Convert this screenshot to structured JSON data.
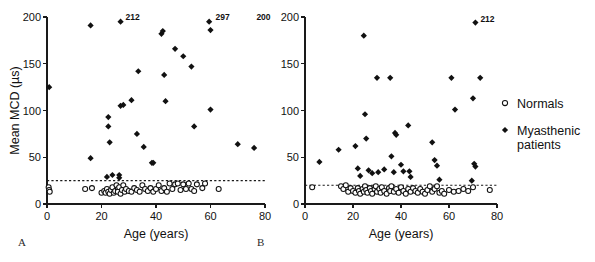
{
  "figure": {
    "panels": [
      {
        "letter": "A",
        "letter_x": 18,
        "letter_y": 246
      },
      {
        "letter": "B",
        "letter_x": 257,
        "letter_y": 246
      }
    ]
  },
  "legend": {
    "position": "right",
    "entries": [
      {
        "label": "Normals",
        "marker": "open-circle"
      },
      {
        "label": "Myasthenic",
        "label2": "patients",
        "marker": "filled-diamond"
      }
    ]
  },
  "colors": {
    "ink": "#111111",
    "axis": "#1a1a1a",
    "paper": "#ffffff"
  },
  "chart_data": [
    {
      "type": "scatter",
      "panel": "A",
      "title": "",
      "xlabel": "Age (years)",
      "ylabel": "Mean MCD (µs)",
      "xlim": [
        0,
        80
      ],
      "ylim": [
        0,
        200
      ],
      "xticks": [
        0,
        20,
        40,
        60,
        80
      ],
      "yticks": [
        0,
        50,
        100,
        150,
        200
      ],
      "grid": false,
      "reference_line": {
        "y": 25,
        "style": "dotted",
        "label": ""
      },
      "annotations": [
        {
          "text": "212",
          "x": 27,
          "y": 196
        },
        {
          "text": "297",
          "x": 60,
          "y": 196
        },
        {
          "text": "200",
          "x": 75,
          "y": 196
        }
      ],
      "series": [
        {
          "name": "Myasthenic patients",
          "marker": "filled-diamond",
          "points": [
            [
              0.8,
              125
            ],
            [
              16,
              191
            ],
            [
              16,
              49
            ],
            [
              22.5,
              93
            ],
            [
              22.5,
              83
            ],
            [
              23,
              66
            ],
            [
              22,
              29
            ],
            [
              24,
              31
            ],
            [
              26.5,
              31
            ],
            [
              26.5,
              28
            ],
            [
              27,
              195
            ],
            [
              27,
              105
            ],
            [
              28,
              106
            ],
            [
              31,
              111
            ],
            [
              33,
              75
            ],
            [
              33.5,
              142
            ],
            [
              35.5,
              61
            ],
            [
              38.5,
              44
            ],
            [
              39,
              44
            ],
            [
              42,
              182
            ],
            [
              42.5,
              185
            ],
            [
              43,
              138
            ],
            [
              43.5,
              110
            ],
            [
              47,
              166
            ],
            [
              50,
              158
            ],
            [
              53,
              147
            ],
            [
              54,
              83
            ],
            [
              59.5,
              195
            ],
            [
              60,
              186
            ],
            [
              60,
              101
            ],
            [
              70,
              64
            ],
            [
              76,
              60
            ]
          ]
        },
        {
          "name": "Normals",
          "marker": "open-circle",
          "points": [
            [
              0.6,
              18
            ],
            [
              0.8,
              15
            ],
            [
              1,
              13
            ],
            [
              14,
              16
            ],
            [
              16.5,
              17
            ],
            [
              20,
              12
            ],
            [
              21,
              14
            ],
            [
              21.5,
              12
            ],
            [
              22,
              16
            ],
            [
              22.5,
              13
            ],
            [
              23,
              11
            ],
            [
              23.5,
              15
            ],
            [
              24,
              18
            ],
            [
              24.5,
              12
            ],
            [
              25,
              14
            ],
            [
              25.5,
              20
            ],
            [
              26,
              16
            ],
            [
              26,
              13
            ],
            [
              26.5,
              18
            ],
            [
              27,
              11
            ],
            [
              27.5,
              15
            ],
            [
              28,
              20
            ],
            [
              28.5,
              13
            ],
            [
              29,
              16
            ],
            [
              30,
              14
            ],
            [
              31,
              13
            ],
            [
              32,
              17
            ],
            [
              33,
              15
            ],
            [
              34,
              13
            ],
            [
              35,
              20
            ],
            [
              36,
              16
            ],
            [
              37,
              14
            ],
            [
              38,
              17
            ],
            [
              39,
              13
            ],
            [
              40,
              16
            ],
            [
              41,
              20
            ],
            [
              42,
              14
            ],
            [
              43,
              17
            ],
            [
              44,
              13
            ],
            [
              45,
              22
            ],
            [
              46,
              16
            ],
            [
              47,
              21
            ],
            [
              48,
              22
            ],
            [
              49,
              15
            ],
            [
              50,
              21
            ],
            [
              51,
              16
            ],
            [
              52,
              22
            ],
            [
              53,
              16
            ],
            [
              54,
              14
            ],
            [
              55,
              21
            ],
            [
              57,
              17
            ],
            [
              58,
              22
            ],
            [
              63,
              16
            ]
          ]
        }
      ]
    },
    {
      "type": "scatter",
      "panel": "B",
      "title": "",
      "xlabel": "Age (years)",
      "ylabel": "",
      "xlim": [
        0,
        80
      ],
      "ylim": [
        0,
        200
      ],
      "xticks": [
        0,
        20,
        40,
        60,
        80
      ],
      "yticks": [
        0,
        50,
        100,
        150,
        200
      ],
      "grid": false,
      "reference_line": {
        "y": 20,
        "style": "dotted",
        "label": ""
      },
      "annotations": [
        {
          "text": "212",
          "x": 71,
          "y": 194
        }
      ],
      "series": [
        {
          "name": "Myasthenic patients",
          "marker": "filled-diamond",
          "points": [
            [
              6,
              45
            ],
            [
              14,
              58
            ],
            [
              21,
              62
            ],
            [
              24.5,
              180
            ],
            [
              22,
              38
            ],
            [
              23,
              30
            ],
            [
              25,
              96
            ],
            [
              25.5,
              70
            ],
            [
              26.5,
              36
            ],
            [
              28,
              33
            ],
            [
              30,
              135
            ],
            [
              30.5,
              34
            ],
            [
              33,
              37
            ],
            [
              35.5,
              135
            ],
            [
              36,
              51
            ],
            [
              37,
              34
            ],
            [
              37.5,
              76
            ],
            [
              38,
              74
            ],
            [
              40,
              42
            ],
            [
              41,
              35
            ],
            [
              43,
              84
            ],
            [
              43.5,
              35
            ],
            [
              44,
              29
            ],
            [
              53,
              66
            ],
            [
              54,
              47
            ],
            [
              55,
              41
            ],
            [
              56,
              26
            ],
            [
              61,
              135
            ],
            [
              62.5,
              101
            ],
            [
              69.5,
              25
            ],
            [
              70,
              113
            ],
            [
              70.5,
              43
            ],
            [
              71,
              40
            ],
            [
              71,
              194
            ],
            [
              73,
              135
            ]
          ]
        },
        {
          "name": "Normals",
          "marker": "open-circle",
          "points": [
            [
              3,
              18
            ],
            [
              15,
              19
            ],
            [
              16,
              16
            ],
            [
              17,
              20
            ],
            [
              18,
              13
            ],
            [
              19,
              17
            ],
            [
              20,
              14
            ],
            [
              21,
              12
            ],
            [
              22,
              17
            ],
            [
              22.5,
              14
            ],
            [
              23,
              11
            ],
            [
              24,
              16
            ],
            [
              24.5,
              13
            ],
            [
              25,
              19
            ],
            [
              25.5,
              15
            ],
            [
              26,
              12
            ],
            [
              27,
              17
            ],
            [
              27.5,
              14
            ],
            [
              28,
              11
            ],
            [
              29,
              16
            ],
            [
              29.5,
              19
            ],
            [
              30,
              13
            ],
            [
              31,
              16
            ],
            [
              31.5,
              12
            ],
            [
              32,
              18
            ],
            [
              33,
              14
            ],
            [
              34,
              11
            ],
            [
              35,
              17
            ],
            [
              35.5,
              14
            ],
            [
              36,
              19
            ],
            [
              37,
              13
            ],
            [
              38,
              16
            ],
            [
              39,
              12
            ],
            [
              40,
              18
            ],
            [
              41,
              14
            ],
            [
              42,
              11
            ],
            [
              43,
              16
            ],
            [
              44,
              13
            ],
            [
              45,
              17
            ],
            [
              46,
              14
            ],
            [
              47,
              12
            ],
            [
              48,
              16
            ],
            [
              49,
              13
            ],
            [
              50,
              11
            ],
            [
              51,
              15
            ],
            [
              52,
              19
            ],
            [
              53,
              13
            ],
            [
              54,
              16
            ],
            [
              55,
              19
            ],
            [
              56,
              12
            ],
            [
              57,
              14
            ],
            [
              58,
              11
            ],
            [
              60,
              15
            ],
            [
              62,
              13
            ],
            [
              64,
              14
            ],
            [
              66,
              16
            ],
            [
              68,
              14
            ],
            [
              70,
              18
            ],
            [
              77,
              15
            ]
          ]
        }
      ]
    }
  ]
}
